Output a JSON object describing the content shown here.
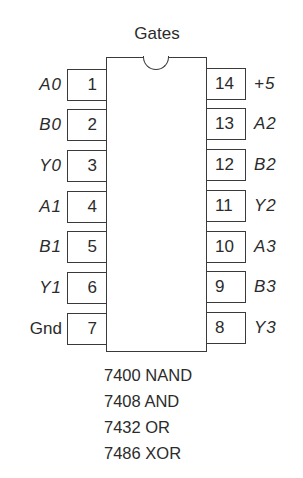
{
  "title": "Gates",
  "chip": {
    "pin_count": 14,
    "left_pins": [
      {
        "number": "1",
        "signal": "A0",
        "italic": true
      },
      {
        "number": "2",
        "signal": "B0",
        "italic": true
      },
      {
        "number": "3",
        "signal": "Y0",
        "italic": true
      },
      {
        "number": "4",
        "signal": "A1",
        "italic": true
      },
      {
        "number": "5",
        "signal": "B1",
        "italic": true
      },
      {
        "number": "6",
        "signal": "Y1",
        "italic": true
      },
      {
        "number": "7",
        "signal": "Gnd",
        "italic": false
      }
    ],
    "right_pins": [
      {
        "number": "14",
        "signal": "+5",
        "italic": true
      },
      {
        "number": "13",
        "signal": "A2",
        "italic": true
      },
      {
        "number": "12",
        "signal": "B2",
        "italic": true
      },
      {
        "number": "11",
        "signal": "Y2",
        "italic": true
      },
      {
        "number": "10",
        "signal": "A3",
        "italic": true
      },
      {
        "number": "9",
        "signal": "B3",
        "italic": true
      },
      {
        "number": "8",
        "signal": "Y3",
        "italic": true
      }
    ]
  },
  "parts": [
    "7400 NAND",
    "7408 AND",
    "7432 OR",
    "7486 XOR"
  ]
}
